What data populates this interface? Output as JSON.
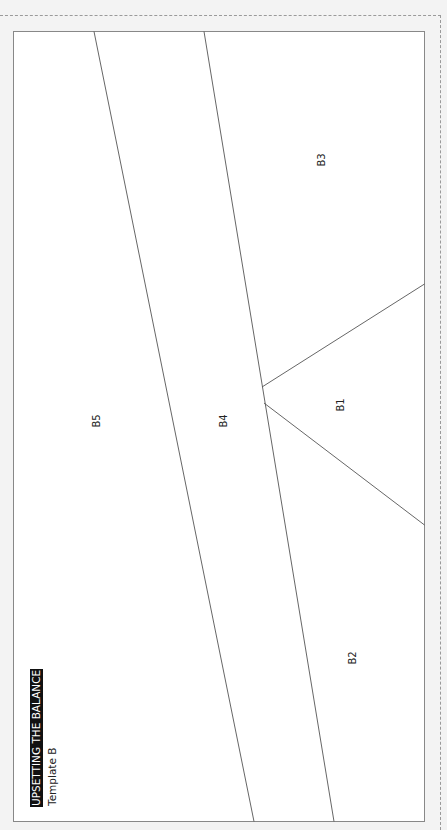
{
  "title": "UPSETTING THE BALANCE",
  "subtitle": "Template B",
  "colors": {
    "background": "#f3f3f3",
    "panel": "#ffffff",
    "line": "#555555",
    "frame": "#888888",
    "title_bg": "#111111",
    "title_text": "#ffffff"
  },
  "regions": [
    {
      "id": "B1",
      "label": "B1"
    },
    {
      "id": "B2",
      "label": "B2"
    },
    {
      "id": "B3",
      "label": "B3"
    },
    {
      "id": "B4",
      "label": "B4"
    },
    {
      "id": "B5",
      "label": "B5"
    }
  ]
}
